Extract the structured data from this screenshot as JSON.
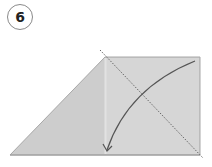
{
  "step": {
    "number": "6"
  },
  "diagram": {
    "paper_fill": "#cfcfcf",
    "panel_fill": "#d9d9d9",
    "edge_color": "#a8a8a8",
    "crease_line": "dotted diagonal valley fold",
    "arrow": "curved fold arrow down-left",
    "arrow_color": "#555555"
  }
}
